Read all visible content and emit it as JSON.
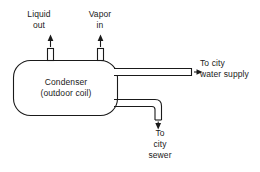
{
  "diagram": {
    "stroke_color": "#1a1a1a",
    "background_color": "#ffffff",
    "vessel": {
      "name": "condenser-vessel",
      "line1": "Condenser",
      "line2": "(outdoor coil)"
    },
    "ports": {
      "liquid_out": {
        "line1": "Liquid",
        "line2": "out",
        "flow_direction": "up"
      },
      "vapor_in": {
        "line1": "Vapor",
        "line2": "in",
        "flow_direction": "up"
      }
    },
    "pipes": {
      "water_supply": {
        "line1": "To city",
        "line2": "water supply",
        "flow_direction": "right"
      },
      "city_sewer": {
        "line1": "To",
        "line2": "city",
        "line3": "sewer",
        "flow_direction": "down"
      }
    }
  }
}
